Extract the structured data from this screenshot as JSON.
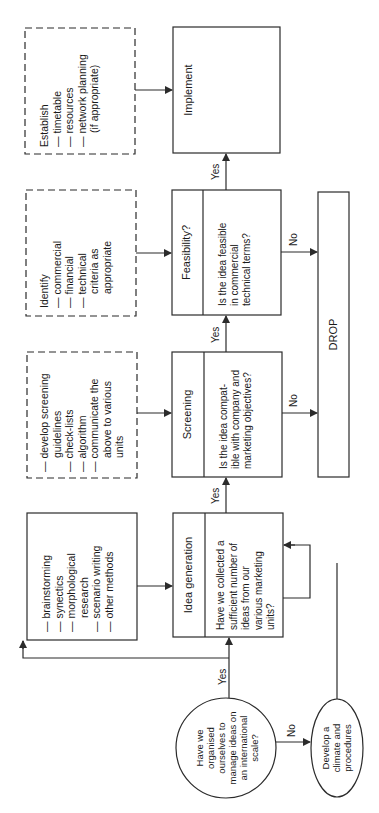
{
  "diagram": {
    "orientation": "rotated-90-ccw",
    "stroke_color": "#2b2b2b",
    "background": "#ffffff",
    "main_boxes": [
      {
        "id": "idea-generation",
        "title": "Idea generation",
        "question": [
          "Have we collected a",
          "sufficient number of",
          "ideas from our",
          "various marketing",
          "units?"
        ]
      },
      {
        "id": "screening",
        "title": "Screening",
        "question": [
          "Is the idea compat-",
          "ible with company and",
          "marketing objectives?"
        ]
      },
      {
        "id": "feasibility",
        "title": "Feasibility?",
        "question": [
          "Is the idea feasible",
          "in commercial",
          "technical terms?"
        ]
      },
      {
        "id": "implement",
        "title": "Implement"
      }
    ],
    "side_boxes": {
      "methods": {
        "style": "solid",
        "lines": [
          "— brainstorming",
          "— synectics",
          "— morphological",
          "research",
          "— scenario writing",
          "— other methods"
        ]
      },
      "screening_guidelines": {
        "style": "dashed",
        "lines": [
          "— develop screening",
          "guidelines",
          "— check-lists",
          "— algorithm",
          "— communicate the",
          "above to various",
          "units"
        ]
      },
      "identify": {
        "style": "dashed",
        "lines": [
          "Identify",
          "— commercial",
          "— financial",
          "— technical",
          "criteria as",
          "appropriate"
        ]
      },
      "establish": {
        "style": "dashed",
        "lines": [
          "Establish",
          "— timetable",
          "— resources",
          "— network planning",
          "(if appropriate)"
        ]
      }
    },
    "start_decision": {
      "lines": [
        "Have we",
        "organised",
        "ourselves to",
        "manage ideas on",
        "an international",
        "scale?"
      ]
    },
    "develop_node": {
      "lines": [
        "Develop a",
        "climate and",
        "procedures"
      ]
    },
    "drop_box": {
      "label": "DROP"
    },
    "edge_labels": {
      "yes": "Yes",
      "no": "No"
    }
  }
}
